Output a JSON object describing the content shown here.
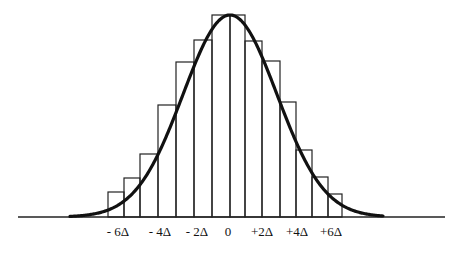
{
  "chart_data": {
    "type": "bar",
    "title": "",
    "xlabel": "",
    "ylabel": "",
    "grid": false,
    "legend": null,
    "tick_labels": [
      "- 6Δ",
      "- 4Δ",
      "- 2Δ",
      "0",
      "+2Δ",
      "+4Δ",
      "+6Δ"
    ],
    "bins": [
      {
        "x0": 108,
        "x1": 124,
        "top": 192
      },
      {
        "x0": 124,
        "x1": 140,
        "top": 178
      },
      {
        "x0": 140,
        "x1": 158,
        "top": 154
      },
      {
        "x0": 158,
        "x1": 176,
        "top": 105
      },
      {
        "x0": 176,
        "x1": 194,
        "top": 62
      },
      {
        "x0": 194,
        "x1": 212,
        "top": 40
      },
      {
        "x0": 212,
        "x1": 230,
        "top": 15
      },
      {
        "x0": 230,
        "x1": 245,
        "top": 15
      },
      {
        "x0": 245,
        "x1": 262,
        "top": 41
      },
      {
        "x0": 262,
        "x1": 280,
        "top": 61
      },
      {
        "x0": 280,
        "x1": 296,
        "top": 102
      },
      {
        "x0": 296,
        "x1": 312,
        "top": 150
      },
      {
        "x0": 312,
        "x1": 328,
        "top": 177
      },
      {
        "x0": 328,
        "x1": 342,
        "top": 194
      }
    ],
    "relative_heights": [
      0.12,
      0.2,
      0.31,
      0.55,
      0.77,
      0.88,
      1.0,
      1.0,
      0.87,
      0.77,
      0.57,
      0.33,
      0.2,
      0.11
    ],
    "curve": {
      "type": "gaussian",
      "mean_x": 230,
      "sigma_px": 47,
      "peak_y": 15,
      "baseline_y": 217,
      "x_start": 70,
      "x_end": 383
    }
  },
  "axis": {
    "baseline_y": 217,
    "x_start": 18,
    "x_end": 445,
    "labels": [
      {
        "text": "- 6Δ",
        "x": 118
      },
      {
        "text": "- 4Δ",
        "x": 160
      },
      {
        "text": "- 2Δ",
        "x": 197
      },
      {
        "text": "0",
        "x": 228
      },
      {
        "text": "+2Δ",
        "x": 262
      },
      {
        "text": "+4Δ",
        "x": 297
      },
      {
        "text": "+6Δ",
        "x": 331
      }
    ]
  }
}
